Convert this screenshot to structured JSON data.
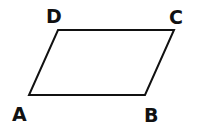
{
  "diagram": {
    "type": "parallelogram",
    "stroke_color": "#111111",
    "background": "#ffffff",
    "vertices": [
      {
        "label": "A",
        "x": 29,
        "y": 95,
        "label_x": 12,
        "label_y": 121
      },
      {
        "label": "B",
        "x": 145,
        "y": 95,
        "label_x": 144,
        "label_y": 122
      },
      {
        "label": "C",
        "x": 174,
        "y": 30,
        "label_x": 169,
        "label_y": 24
      },
      {
        "label": "D",
        "x": 58,
        "y": 30,
        "label_x": 46,
        "label_y": 23
      }
    ],
    "labels": {
      "a": "A",
      "b": "B",
      "c": "C",
      "d": "D"
    }
  }
}
